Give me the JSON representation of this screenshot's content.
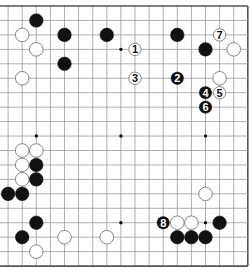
{
  "board": {
    "size": 19,
    "visible_cols": {
      "from": 1,
      "to": 18
    },
    "visible_rows": {
      "from": 0,
      "to": 18
    },
    "edges_shown": [
      "top",
      "bottom",
      "right"
    ],
    "colors": {
      "background": "#ffffff",
      "grid_line": "#9a9a9a",
      "border_line": "#555555",
      "black_stone": "#111111",
      "white_stone": "#ffffff",
      "white_stone_outline": "#777777",
      "star_point": "#111111"
    },
    "star_points": [
      [
        3,
        3
      ],
      [
        9,
        3
      ],
      [
        15,
        3
      ],
      [
        3,
        9
      ],
      [
        9,
        9
      ],
      [
        15,
        9
      ],
      [
        3,
        15
      ],
      [
        9,
        15
      ],
      [
        15,
        15
      ]
    ]
  },
  "stones": [
    {
      "color": "black",
      "col": 3,
      "row": 1
    },
    {
      "color": "white",
      "col": 2,
      "row": 2
    },
    {
      "color": "black",
      "col": 5,
      "row": 2
    },
    {
      "color": "black",
      "col": 8,
      "row": 2
    },
    {
      "color": "black",
      "col": 13,
      "row": 2
    },
    {
      "color": "white",
      "col": 3,
      "row": 3
    },
    {
      "color": "black",
      "col": 15,
      "row": 3
    },
    {
      "color": "white",
      "col": 17,
      "row": 3
    },
    {
      "color": "black",
      "col": 5,
      "row": 4
    },
    {
      "color": "white",
      "col": 2,
      "row": 5
    },
    {
      "color": "white",
      "col": 16,
      "row": 5
    },
    {
      "color": "white",
      "col": 2,
      "row": 10
    },
    {
      "color": "white",
      "col": 3,
      "row": 10
    },
    {
      "color": "white",
      "col": 2,
      "row": 11
    },
    {
      "color": "black",
      "col": 3,
      "row": 11
    },
    {
      "color": "white",
      "col": 2,
      "row": 12
    },
    {
      "color": "black",
      "col": 3,
      "row": 12
    },
    {
      "color": "black",
      "col": 1,
      "row": 13
    },
    {
      "color": "black",
      "col": 2,
      "row": 13
    },
    {
      "color": "white",
      "col": 15,
      "row": 13
    },
    {
      "color": "black",
      "col": 3,
      "row": 15
    },
    {
      "color": "white",
      "col": 13,
      "row": 15
    },
    {
      "color": "white",
      "col": 14,
      "row": 15
    },
    {
      "color": "black",
      "col": 16,
      "row": 15
    },
    {
      "color": "black",
      "col": 2,
      "row": 16
    },
    {
      "color": "white",
      "col": 5,
      "row": 16
    },
    {
      "color": "white",
      "col": 8,
      "row": 16
    },
    {
      "color": "black",
      "col": 13,
      "row": 16
    },
    {
      "color": "black",
      "col": 14,
      "row": 16
    },
    {
      "color": "black",
      "col": 15,
      "row": 16
    },
    {
      "color": "white",
      "col": 3,
      "row": 17
    }
  ],
  "moves": [
    {
      "number": "1",
      "color": "white",
      "col": 10,
      "row": 3
    },
    {
      "number": "2",
      "color": "black",
      "col": 13,
      "row": 5
    },
    {
      "number": "3",
      "color": "white",
      "col": 10,
      "row": 5
    },
    {
      "number": "4",
      "color": "black",
      "col": 15,
      "row": 6
    },
    {
      "number": "5",
      "color": "white",
      "col": 16,
      "row": 6
    },
    {
      "number": "6",
      "color": "black",
      "col": 15,
      "row": 7
    },
    {
      "number": "7",
      "color": "white",
      "col": 16,
      "row": 2
    },
    {
      "number": "8",
      "color": "black",
      "col": 12,
      "row": 15
    }
  ]
}
